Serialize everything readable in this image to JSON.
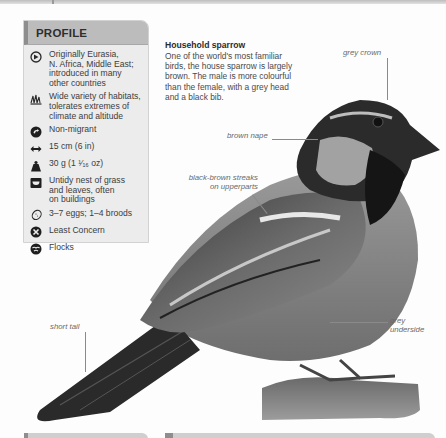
{
  "profile": {
    "title": "PROFILE",
    "items": [
      {
        "icon": "globe-range-icon",
        "text": "Originally Eurasia,\nN. Africa, Middle East;\nintroduced in many\nother countries"
      },
      {
        "icon": "habitat-grass-icon",
        "text": "Wide variety of habitats,\ntolerates extremes of\nclimate and altitude"
      },
      {
        "icon": "migration-icon",
        "text": "Non-migrant"
      },
      {
        "icon": "length-arrows-icon",
        "text": "15 cm (6 in)"
      },
      {
        "icon": "weight-icon",
        "text": "30 g (1 ¹⁄₁₆ oz)"
      },
      {
        "icon": "nest-icon",
        "text": "Untidy nest of grass\nand leaves, often\non buildings"
      },
      {
        "icon": "egg-icon",
        "text": "3–7 eggs; 1–4 broods"
      },
      {
        "icon": "conservation-status-icon",
        "text": "Least Concern"
      },
      {
        "icon": "social-flock-icon",
        "text": "Flocks"
      }
    ]
  },
  "intro": {
    "title": "Household sparrow",
    "body": "One of the world's most familiar birds, the house sparrow is largely brown. The male is more colourful than the female, with a grey head and a black bib."
  },
  "labels": {
    "grey_crown": "grey crown",
    "brown_nape": "brown nape",
    "streaks": "black-brown streaks\non upperparts",
    "short_tail": "short tail",
    "grey_underside": "grey\nunderside"
  },
  "colors": {
    "panel_bg": "#ececec",
    "panel_header": "#bcbcbc",
    "accent_bar": "#8e8e8e",
    "text": "#3c3c3c",
    "label_text": "#6a6a6a"
  }
}
